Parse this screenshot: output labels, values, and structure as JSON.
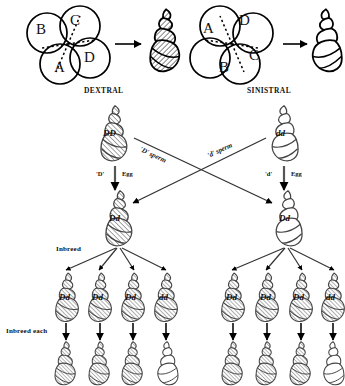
{
  "figure": {
    "top_panel": {
      "left_embryo": {
        "label": "DEXTRAL",
        "cells": [
          {
            "name": "B",
            "pos": "upper-left"
          },
          {
            "name": "C",
            "pos": "upper-right"
          },
          {
            "name": "D",
            "pos": "lower-right"
          },
          {
            "name": "A",
            "pos": "lower-left"
          }
        ],
        "shell_shaded": true
      },
      "right_embryo": {
        "label": "SINISTRAL",
        "cells": [
          {
            "name": "A",
            "pos": "upper-left"
          },
          {
            "name": "D",
            "pos": "upper-right"
          },
          {
            "name": "C",
            "pos": "lower-right"
          },
          {
            "name": "B",
            "pos": "lower-left"
          }
        ],
        "shell_shaded": false
      }
    },
    "cross": {
      "parent_left": {
        "genotype": "DD",
        "shaded": true
      },
      "parent_right": {
        "genotype": "dd",
        "shaded": false
      },
      "sperm_left_label": "'D' sperm",
      "sperm_right_label": "'d' sperm",
      "egg_left_allele": "'D'",
      "egg_left_label": "Egg",
      "egg_right_allele": "'d'",
      "egg_right_label": "Egg",
      "f1_left": {
        "genotype": "Dd",
        "shaded": true
      },
      "f1_right": {
        "genotype": "Dd",
        "shaded": false
      }
    },
    "inbreed": {
      "label": "Inbreed",
      "left_row": [
        {
          "genotype": "Dd",
          "shaded": true
        },
        {
          "genotype": "Dd",
          "shaded": true
        },
        {
          "genotype": "Dd",
          "shaded": true
        },
        {
          "genotype": "dd",
          "shaded": true
        }
      ],
      "right_row": [
        {
          "genotype": "Dd",
          "shaded": true
        },
        {
          "genotype": "Dd",
          "shaded": true
        },
        {
          "genotype": "Dd",
          "shaded": true
        },
        {
          "genotype": "dd",
          "shaded": true
        }
      ]
    },
    "inbreed_each": {
      "label": "Inbreed each",
      "left_row": [
        {
          "shaded": true
        },
        {
          "shaded": true
        },
        {
          "shaded": true
        },
        {
          "shaded": false
        }
      ],
      "right_row": [
        {
          "shaded": true
        },
        {
          "shaded": true
        },
        {
          "shaded": true
        },
        {
          "shaded": false
        }
      ]
    }
  }
}
